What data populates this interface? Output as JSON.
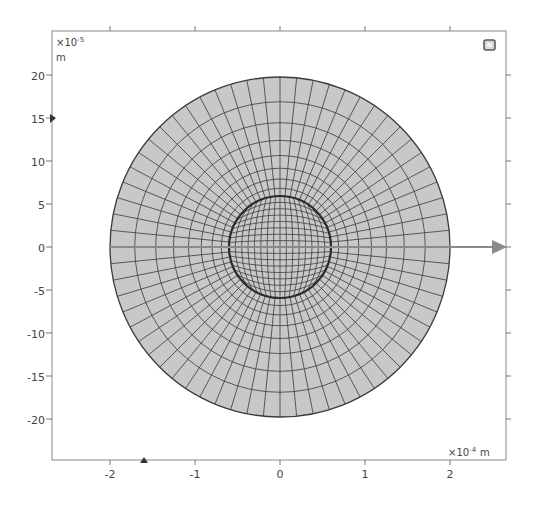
{
  "window": {
    "title": "Graphics"
  },
  "axes": {
    "x": {
      "ticks": [
        "-2",
        "-1",
        "0",
        "1",
        "2"
      ],
      "tick_values": [
        -2,
        -1,
        0,
        1,
        2
      ],
      "range": [
        -2.7,
        2.7
      ],
      "multiplier": "×10",
      "exponent": "-4",
      "unit": "m"
    },
    "y": {
      "ticks": [
        "20",
        "15",
        "10",
        "5",
        "0",
        "-5",
        "-10",
        "-15",
        "-20"
      ],
      "tick_values": [
        20,
        15,
        10,
        5,
        0,
        -5,
        -10,
        -15,
        -20
      ],
      "range": [
        -24.5,
        24.5
      ],
      "multiplier": "×10",
      "exponent": "-5",
      "unit": "m"
    }
  },
  "geometry": {
    "outer_circle_radius": 2.0,
    "inner_circle_radius": 0.6,
    "units": "×10^-4 m",
    "mesh": {
      "type": "mapped quadrilateral",
      "inner_grid_divisions": 16,
      "outer_radial_layers": 8,
      "outer_angular_divisions": 64
    },
    "fill_color": "#c8c8c8",
    "mesh_color": "#3a3a3a",
    "axis_arrow": {
      "direction": "x",
      "color": "#8a8a8a"
    }
  },
  "icons": {
    "view_cube": "view-cube-icon",
    "x_axis_arrow": "arrow-right-icon",
    "bottom_marker": "triangle-up-icon",
    "left_marker": "triangle-right-icon"
  }
}
